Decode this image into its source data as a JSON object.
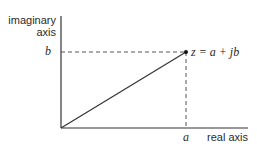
{
  "diagram": {
    "y_axis_label_line1": "imaginary",
    "y_axis_label_line2": "axis",
    "x_axis_label": "real axis",
    "tick_x": "a",
    "tick_y": "b",
    "point_label": "z = a + jb",
    "colors": {
      "line": "#333333",
      "background": "#ffffff"
    }
  }
}
